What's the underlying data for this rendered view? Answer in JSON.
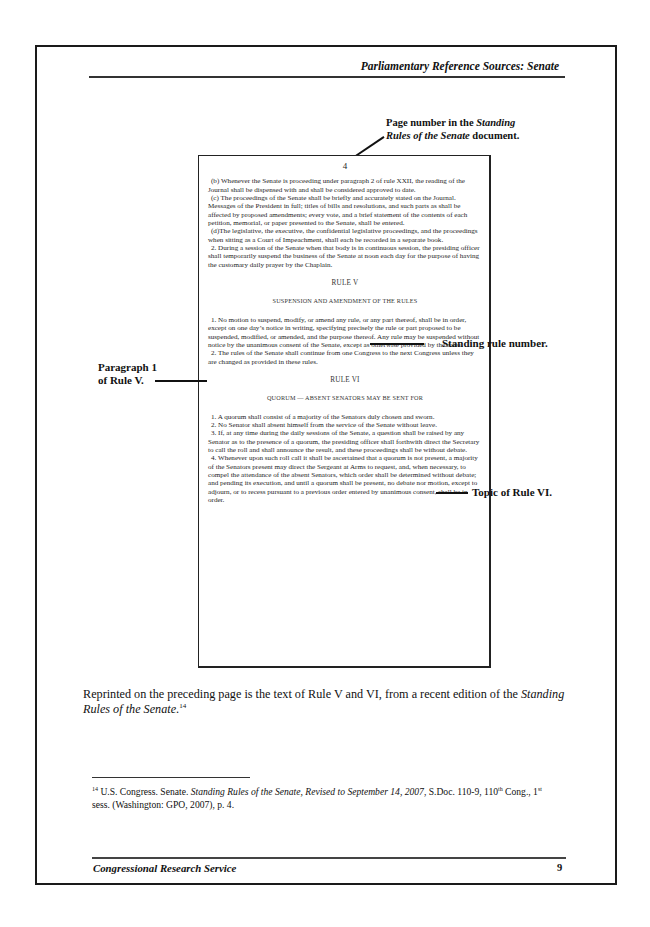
{
  "header": {
    "running_title": "Parliamentary Reference Sources: Senate"
  },
  "callouts": {
    "page_number": {
      "line1_plain": "Page number in the ",
      "line1_italic": "Standing",
      "line2_italic": "Rules of the Senate",
      "line2_plain": " document."
    },
    "rule_number": "Standing rule number.",
    "paragraph": {
      "line1": "Paragraph 1",
      "line2": "of Rule V."
    },
    "topic": "Topic of Rule VI."
  },
  "excerpt": {
    "page_number": "4",
    "paragraphs_before": [
      "(b) Whenever the Senate is proceeding under paragraph 2 of rule XXII, the reading of the Journal shall be dispensed with and shall be considered approved to date.",
      "(c) The proceedings of the Senate shall be briefly and accurately stated on the Journal. Messages of the President in full; titles of bills and resolutions, and such parts as shall be affected by proposed amendments; every vote, and a brief statement of the contents of each petition, memorial, or paper presented to the Senate, shall be entered.",
      "(d)The legislative, the executive, the confidential legislative proceedings, and the proceedings when sitting as a Court of Impeachment, shall each be recorded in a separate book.",
      "2. During a session of the Senate when that body is in continuous session, the presiding officer shall temporarily suspend the business of the Senate at noon each day for the purpose of having the customary daily prayer by the Chaplain."
    ],
    "rule5": {
      "heading": "RULE V",
      "subject": "SUSPENSION AND AMENDMENT OF THE RULES",
      "paragraphs": [
        "1. No motion to suspend, modify, or amend any rule, or any part thereof, shall be in order, except on one day’s notice in writing, specifying precisely the rule or part proposed to be suspended, modified, or amended, and the purpose thereof. Any rule may be suspended without notice by the unanimous consent of the Senate, except as otherwise provided by the rules.",
        "2. The rules of the Senate shall continue from one Congress to the next Congress unless they are changed as provided in these rules."
      ]
    },
    "rule6": {
      "heading": "RULE VI",
      "subject": "QUORUM — ABSENT SENATORS MAY BE SENT FOR",
      "paragraphs": [
        "1. A quorum shall consist of a majority of the Senators duly chosen and sworn.",
        "2. No Senator shall absent himself from the service of the Senate without leave.",
        "3. If, at any time during the daily sessions of the Senate, a question shall be raised by any Senator as to the presence of a quorum, the presiding officer shall forthwith direct the Secretary to call the roll and shall announce the result, and these proceedings shall be without debate.",
        "4. Whenever upon such roll call it shall be ascertained that a quorum is not present, a majority of the Senators present may direct the Sergeant at Arms to request, and, when necessary, to compel the attendance of the absent Senators, which order shall be determined without debate; and pending its execution, and until a quorum shall be present, no debate nor motion, except to adjourn, or to recess pursuant to a previous order entered by unanimous consent, shall be in order."
      ]
    }
  },
  "body": {
    "text_plain": "Reprinted on the preceding page is the text of Rule V and VI, from a recent edition of the ",
    "text_italic": "Standing Rules of the Senate",
    "text_end": ".",
    "footnote_ref": "14"
  },
  "footnote": {
    "number": "14",
    "part1": " U.S. Congress. Senate. ",
    "italic": "Standing Rules of the Senate, Revised to September 14, 2007",
    "part2": ", S.Doc. 110-9, 110",
    "sup1": "th",
    "part3": " Cong., 1",
    "sup2": "st",
    "part4": " sess. (Washington: GPO, 2007), p. 4."
  },
  "footer": {
    "organization": "Congressional Research Service",
    "page_number": "9"
  }
}
